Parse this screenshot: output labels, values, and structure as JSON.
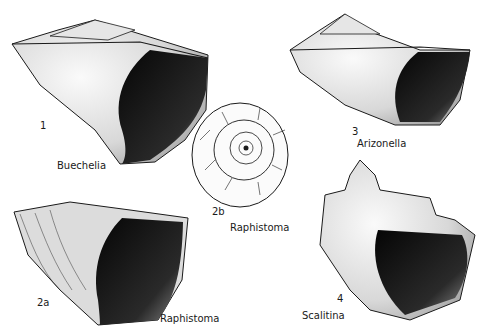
{
  "plate": {
    "figures": [
      {
        "number": "1",
        "genus": "Buechelia",
        "view": "apertural side view"
      },
      {
        "number": "2a",
        "genus": "Raphistoma",
        "view": "apertural side view"
      },
      {
        "number": "2b",
        "genus": "Raphistoma",
        "view": "apical top view"
      },
      {
        "number": "3",
        "genus": "Arizonella",
        "view": "apertural side view"
      },
      {
        "number": "4",
        "genus": "Scalitina",
        "view": "apertural side view"
      }
    ]
  },
  "colors": {
    "ink": "#1a1a1a",
    "paper": "#ffffff",
    "shadow": "#0d0d0d"
  }
}
